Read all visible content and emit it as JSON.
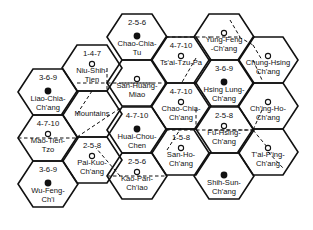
{
  "diagram": {
    "type": "hexagonal-market-area-map",
    "hexes": [
      {
        "id": "liao-chia-chang",
        "name_lines": [
          "Liao-Chia-",
          "Ch'ang"
        ],
        "code": "3-6-9",
        "marker": "major",
        "cx": 48,
        "cy": 92
      },
      {
        "id": "mao-tien-tzo",
        "name_lines": [
          "Mao-Tien-",
          "Tzo"
        ],
        "code": "4-7-10",
        "marker": "minor",
        "cx": 48,
        "cy": 138
      },
      {
        "id": "wu-feng-chi",
        "name_lines": [
          "Wu-Feng-",
          "Ch'i"
        ],
        "code": "3-6-9",
        "marker": "major",
        "cx": 48,
        "cy": 184
      },
      {
        "id": "niu-shih-tien",
        "name_lines": [
          "Niu-Shih-",
          "Tien"
        ],
        "code": "1-4-7",
        "marker": "minor",
        "cx": 92,
        "cy": 68
      },
      {
        "id": "mountains",
        "name_lines": [
          "Mountains"
        ],
        "code": "",
        "marker": "none",
        "cx": 92,
        "cy": 114
      },
      {
        "id": "pai-kuo-chang",
        "name_lines": [
          "Pai-Kuo-",
          "Ch'ang"
        ],
        "code": "2-5-8",
        "marker": "minor",
        "cx": 92,
        "cy": 160
      },
      {
        "id": "chao-chia-tu",
        "name_lines": [
          "Chao-Chia-",
          "Tu"
        ],
        "code": "2-5-6",
        "marker": "major",
        "cx": 137,
        "cy": 37
      },
      {
        "id": "san-huang-miao",
        "name_lines": [
          "San-Huang-",
          "Miao"
        ],
        "code": "",
        "marker": "minor",
        "cx": 137,
        "cy": 83
      },
      {
        "id": "huai-chou-chen",
        "name_lines": [
          "Huai-Chou-",
          "Chen"
        ],
        "code": "4-7-10",
        "marker": "major",
        "cx": 137,
        "cy": 130
      },
      {
        "id": "kao-pan-chiao",
        "name_lines": [
          "Kao-Pan-",
          "Ch'iao"
        ],
        "code": "2-5-6",
        "marker": "minor",
        "cx": 137,
        "cy": 176
      },
      {
        "id": "tsai-tzu-pa",
        "name_lines": [
          "Ts'ai-Tzu-Pa"
        ],
        "code": "4-7-10",
        "marker": "minor",
        "cx": 181,
        "cy": 60
      },
      {
        "id": "chao-chia-chang",
        "name_lines": [
          "Chao-Chia-",
          "Ch'ang"
        ],
        "code": "4-7-10",
        "marker": "minor",
        "cx": 181,
        "cy": 106
      },
      {
        "id": "san-ho-chang",
        "name_lines": [
          "San-Ho-",
          "Ch'ang"
        ],
        "code": "1-5-8",
        "marker": "minor",
        "cx": 181,
        "cy": 152
      },
      {
        "id": "yung-feng-chang",
        "name_lines": [
          "Yung-Feng",
          "-Ch'ang"
        ],
        "code": "",
        "marker": "minor",
        "cx": 224,
        "cy": 37
      },
      {
        "id": "hsing-lung-chang",
        "name_lines": [
          "Hsing Lung-",
          "Ch'ang"
        ],
        "code": "3-6-9",
        "marker": "major",
        "cx": 224,
        "cy": 83
      },
      {
        "id": "fu-hsing-chang",
        "name_lines": [
          "Fu-Hsing-",
          "Ch'ang"
        ],
        "code": "2-5-8",
        "marker": "minor",
        "cx": 224,
        "cy": 130
      },
      {
        "id": "shih-sun-chang",
        "name_lines": [
          "Shih-Sun-",
          "Ch'ang"
        ],
        "code": "",
        "marker": "major",
        "cx": 224,
        "cy": 176
      },
      {
        "id": "chung-hsing-chang",
        "name_lines": [
          "Chung-Hsing",
          "Ch'ang"
        ],
        "code": "",
        "marker": "minor",
        "cx": 268,
        "cy": 60
      },
      {
        "id": "ching-ho-chang",
        "name_lines": [
          "Ch'ing-Ho-",
          "Ch'ang"
        ],
        "code": "",
        "marker": "minor",
        "cx": 268,
        "cy": 106
      },
      {
        "id": "tai-ping-chang",
        "name_lines": [
          "T'ai-P'ing-",
          "Ch'ang"
        ],
        "code": "",
        "marker": "minor",
        "cx": 268,
        "cy": 152
      }
    ],
    "dashed_links": [
      [
        77,
        83,
        152,
        83
      ],
      [
        122,
        83,
        167,
        83
      ],
      [
        18,
        138,
        78,
        138
      ],
      [
        107,
        176,
        167,
        176
      ],
      [
        166,
        37,
        210,
        37
      ],
      [
        210,
        37,
        239,
        37
      ],
      [
        166,
        130,
        254,
        130
      ],
      [
        209,
        130,
        254,
        130
      ],
      [
        230,
        20,
        240,
        37
      ],
      [
        239,
        37,
        253,
        45
      ],
      [
        253,
        45,
        262,
        60
      ],
      [
        107,
        68,
        107,
        92
      ],
      [
        77,
        114,
        92,
        91
      ],
      [
        77,
        137,
        122,
        107
      ],
      [
        120,
        176,
        96,
        148
      ],
      [
        196,
        58,
        181,
        84
      ],
      [
        196,
        109,
        196,
        125
      ],
      [
        167,
        150,
        181,
        128
      ],
      [
        253,
        60,
        262,
        80
      ],
      [
        262,
        110,
        253,
        130
      ],
      [
        253,
        130,
        268,
        148
      ],
      [
        268,
        152,
        283,
        168
      ]
    ],
    "legend": {
      "major_marker": "filled-circle",
      "minor_marker": "open-circle"
    }
  }
}
